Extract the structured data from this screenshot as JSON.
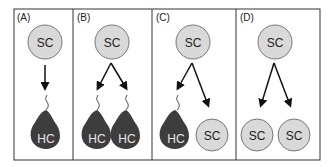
{
  "figure": {
    "panels": [
      {
        "label": "(A)",
        "top": "SC",
        "outcomes": [
          "HC"
        ],
        "description": "SC gives rise to one hair cell"
      },
      {
        "label": "(B)",
        "top": "SC",
        "outcomes": [
          "HC",
          "HC"
        ],
        "description": "SC gives rise to two hair cells"
      },
      {
        "label": "(C)",
        "top": "SC",
        "outcomes": [
          "HC",
          "SC"
        ],
        "description": "SC gives rise to one hair cell and one supporting cell"
      },
      {
        "label": "(D)",
        "top": "SC",
        "outcomes": [
          "SC",
          "SC"
        ],
        "description": "SC gives rise to two supporting cells"
      }
    ],
    "colors": {
      "sc_fill": "#d9d9d9",
      "sc_stroke": "#777777",
      "hc_fill": "#3d3d3d",
      "hc_text": "#e6e6e6",
      "arrow": "#111111",
      "frame": "#333333"
    }
  }
}
